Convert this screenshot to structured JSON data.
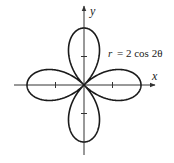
{
  "chart_data": {
    "type": "line",
    "subtype": "polar-curve",
    "title": "",
    "equation": "r = 2 cos 2θ",
    "equation_parts": {
      "lhs": "r",
      "rhs": "= 2 cos 2θ"
    },
    "xlabel": "x",
    "ylabel": "y",
    "xlim": [
      -2.5,
      2.5
    ],
    "ylim": [
      -2.5,
      2.5
    ],
    "x_ticks": [
      -1,
      1
    ],
    "y_ticks": [
      -1,
      1
    ],
    "tick_labels_shown": false,
    "grid": false,
    "legend": null,
    "curve": {
      "name": "four-leaved rose",
      "amplitude": 2,
      "k": 2,
      "function": "cos",
      "petal_count": 4,
      "petal_tips": [
        [
          2,
          0
        ],
        [
          0,
          2
        ],
        [
          -2,
          0
        ],
        [
          0,
          -2
        ]
      ]
    },
    "layout": {
      "origin_px": [
        84,
        85
      ],
      "unit_px": 28.5
    },
    "colors": {
      "curve": "#1a1a1a",
      "axes": "#333333",
      "background": "#ffffff"
    }
  }
}
